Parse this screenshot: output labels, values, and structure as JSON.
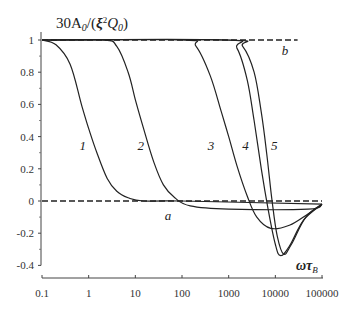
{
  "chart_data": {
    "type": "line",
    "ylabel": "30A₀/(ξ²Q₀)",
    "xlabel": "ωτ_B",
    "xscale": "log",
    "xlim": [
      0.1,
      100000
    ],
    "ylim": [
      -0.4,
      1
    ],
    "x_ticks": [
      "0.1",
      "1",
      "10",
      "100",
      "1000",
      "10000",
      "100000"
    ],
    "y_ticks": [
      "1",
      "0.8",
      "0.6",
      "0.4",
      "0.2",
      "0",
      "-0.2",
      "-0.4"
    ],
    "grid": false,
    "legend": "inline curve labels",
    "series": [
      {
        "name": "1",
        "style": "solid",
        "x": [
          0.1,
          0.2,
          0.4,
          0.7,
          1,
          1.5,
          2.5,
          4,
          7,
          15,
          100,
          100000
        ],
        "values": [
          1.0,
          0.97,
          0.85,
          0.6,
          0.45,
          0.3,
          0.14,
          0.06,
          0.02,
          0.0,
          0.0,
          -0.02
        ]
      },
      {
        "name": "2",
        "style": "solid",
        "x": [
          0.1,
          2,
          4,
          7,
          10,
          15,
          25,
          40,
          70,
          150,
          1000,
          50000,
          100000
        ],
        "values": [
          1.0,
          1.0,
          0.96,
          0.8,
          0.63,
          0.45,
          0.24,
          0.1,
          0.02,
          -0.03,
          -0.05,
          -0.05,
          -0.02
        ]
      },
      {
        "name": "3",
        "style": "solid",
        "x": [
          0.1,
          100,
          200,
          400,
          700,
          1000,
          1500,
          2500,
          4000,
          8000,
          20000,
          50000,
          100000
        ],
        "values": [
          1.0,
          1.0,
          0.96,
          0.78,
          0.55,
          0.4,
          0.22,
          0.03,
          -0.1,
          -0.17,
          -0.15,
          -0.08,
          -0.02
        ]
      },
      {
        "name": "4",
        "style": "solid",
        "x": [
          0.1,
          800,
          1500,
          2500,
          3500,
          5000,
          7000,
          10000,
          13000,
          20000,
          40000,
          100000
        ],
        "values": [
          1.0,
          1.0,
          0.95,
          0.75,
          0.5,
          0.2,
          -0.05,
          -0.27,
          -0.34,
          -0.28,
          -0.12,
          -0.02
        ]
      },
      {
        "name": "5",
        "style": "solid",
        "x": [
          0.1,
          1000,
          2000,
          3500,
          5000,
          6500,
          8500,
          11000,
          15000,
          22000,
          45000,
          100000
        ],
        "values": [
          1.0,
          1.0,
          0.96,
          0.8,
          0.55,
          0.3,
          0.0,
          -0.22,
          -0.33,
          -0.27,
          -0.1,
          -0.02
        ]
      },
      {
        "name": "a",
        "style": "dashed",
        "x": [
          0.1,
          10,
          100000
        ],
        "values": [
          0.0,
          0.0,
          0.0
        ]
      },
      {
        "name": "b",
        "style": "dashed",
        "x": [
          0.1,
          10000,
          30000
        ],
        "values": [
          1.0,
          1.0,
          1.0
        ]
      }
    ],
    "annotations": [
      {
        "text": "1",
        "x": 0.75,
        "y": 0.35
      },
      {
        "text": "2",
        "x": 13,
        "y": 0.35
      },
      {
        "text": "3",
        "x": 420,
        "y": 0.35
      },
      {
        "text": "4",
        "x": 2300,
        "y": 0.35
      },
      {
        "text": "5",
        "x": 9500,
        "y": 0.35
      },
      {
        "text": "a",
        "x": 50,
        "y": -0.09
      },
      {
        "text": "b",
        "x": 16000,
        "y": 0.94
      }
    ]
  },
  "axis": {
    "title": "30A",
    "title_sub": "0",
    "title_mid": "/(",
    "title_xi": "ξ",
    "title_sup": "2",
    "title_q": "Q",
    "title_q_sub": "0",
    "title_end": ")",
    "xlabel_main": "ωτ",
    "xlabel_sub": "B"
  }
}
